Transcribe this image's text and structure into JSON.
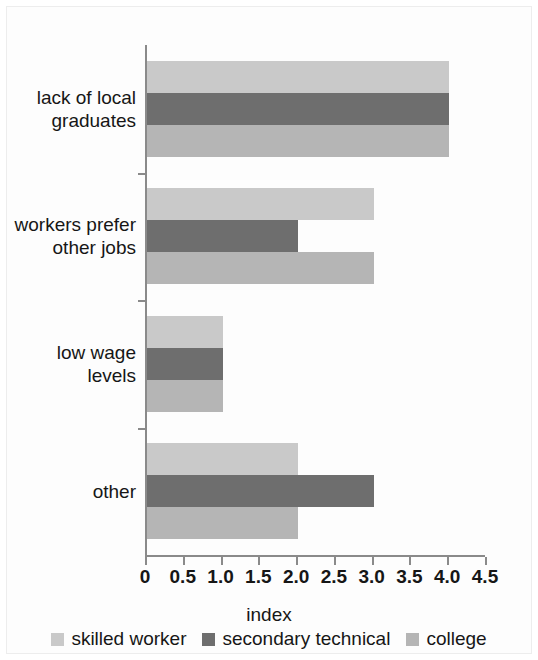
{
  "chart_data": {
    "type": "bar",
    "orientation": "horizontal",
    "title": "",
    "xlabel": "index",
    "ylabel": "",
    "xlim": [
      0,
      4.5
    ],
    "xticks": [
      "0",
      "0.5",
      "1.0",
      "1.5",
      "2.0",
      "2.5",
      "3.0",
      "3.5",
      "4.0",
      "4.5"
    ],
    "xtick_values": [
      0,
      0.5,
      1.0,
      1.5,
      2.0,
      2.5,
      3.0,
      3.5,
      4.0,
      4.5
    ],
    "grid": false,
    "legend_position": "bottom",
    "categories": [
      "lack of local\ngraduates",
      "workers prefer\nother jobs",
      "low wage\nlevels",
      "other"
    ],
    "series": [
      {
        "name": "skilled worker",
        "color": "#c9c9c9",
        "values": [
          4.0,
          3.0,
          1.0,
          2.0
        ]
      },
      {
        "name": "secondary technical",
        "color": "#6e6e6e",
        "values": [
          4.0,
          2.0,
          1.0,
          3.0
        ]
      },
      {
        "name": "college",
        "color": "#b5b5b5",
        "values": [
          4.0,
          3.0,
          1.0,
          2.0
        ]
      }
    ]
  },
  "axis": {
    "title_label": "index",
    "line_color": "#8a8a8a"
  },
  "legend": {
    "items": [
      {
        "label": "skilled worker",
        "color": "#c9c9c9"
      },
      {
        "label": "secondary technical",
        "color": "#6e6e6e"
      },
      {
        "label": "college",
        "color": "#b5b5b5"
      }
    ]
  }
}
